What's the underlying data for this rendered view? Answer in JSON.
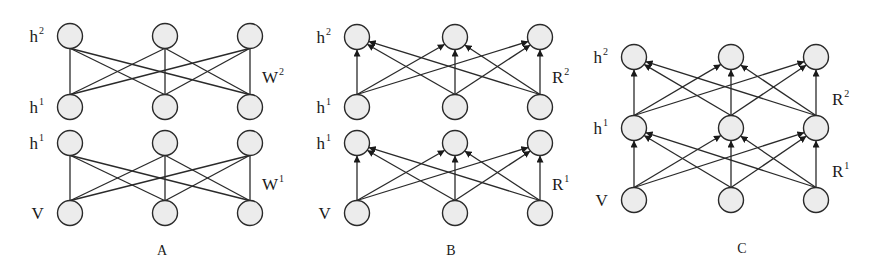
{
  "diagrams": [
    {
      "id": "A",
      "caption": "A",
      "caption_pos": [
        162,
        255
      ],
      "directed": false,
      "columns": [
        70,
        165,
        250
      ],
      "radius": 12.5,
      "blocks": [
        {
          "top": {
            "label": "h",
            "sup": "2",
            "y": 36
          },
          "bottom": {
            "label": "h",
            "sup": "1",
            "y": 107
          },
          "weight": {
            "label": "W",
            "sup": "2",
            "x": 262,
            "y": 77
          }
        },
        {
          "top": {
            "label": "h",
            "sup": "1",
            "y": 143
          },
          "bottom": {
            "label": "V",
            "sup": "",
            "y": 213
          },
          "weight": {
            "label": "W",
            "sup": "1",
            "x": 262,
            "y": 184
          }
        }
      ]
    },
    {
      "id": "B",
      "caption": "B",
      "caption_pos": [
        451,
        255
      ],
      "directed": true,
      "columns": [
        357,
        455,
        540
      ],
      "radius": 12.5,
      "blocks": [
        {
          "top": {
            "label": "h",
            "sup": "2",
            "y": 37
          },
          "bottom": {
            "label": "h",
            "sup": "1",
            "y": 107
          },
          "weight": {
            "label": "R",
            "sup": "2",
            "x": 552,
            "y": 77
          }
        },
        {
          "top": {
            "label": "h",
            "sup": "1",
            "y": 143
          },
          "bottom": {
            "label": "V",
            "sup": "",
            "y": 213
          },
          "weight": {
            "label": "R",
            "sup": "1",
            "x": 552,
            "y": 184
          }
        }
      ]
    },
    {
      "id": "C",
      "caption": "C",
      "caption_pos": [
        742,
        253
      ],
      "directed": true,
      "columns": [
        634,
        731,
        816
      ],
      "radius": 12.5,
      "blocks": [
        {
          "top": {
            "label": "h",
            "sup": "2",
            "y": 57
          },
          "bottom": {
            "label": "h",
            "sup": "1",
            "y": 128
          },
          "weight": {
            "label": "R",
            "sup": "2",
            "x": 832,
            "y": 99
          }
        },
        {
          "top": {
            "label": "h",
            "sup": "1",
            "y": 128
          },
          "bottom": {
            "label": "V",
            "sup": "",
            "y": 200
          },
          "weight": {
            "label": "R",
            "sup": "1",
            "x": 832,
            "y": 171
          }
        }
      ]
    }
  ]
}
